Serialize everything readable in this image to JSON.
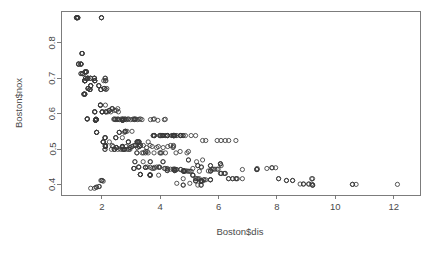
{
  "chart_data": {
    "type": "scatter",
    "title": "",
    "xlabel": "Boston$dis",
    "ylabel": "Boston$nox",
    "xlim": [
      0.6,
      12.9
    ],
    "ylim": [
      0.37,
      0.89
    ],
    "xticks": [
      2,
      4,
      6,
      8,
      10,
      12
    ],
    "xtick_labels": [
      "2",
      "4",
      "6",
      "8",
      "10",
      "12"
    ],
    "yticks": [
      0.4,
      0.5,
      0.6,
      0.7,
      0.8
    ],
    "ytick_labels": [
      "0.4",
      "0.5",
      "0.6",
      "0.7",
      "0.8"
    ],
    "grid": false,
    "legend": null,
    "point_symbol": "open-circle",
    "point_color": "#3a3a3a",
    "background_color": "#ffffff",
    "n_points": 506,
    "x": [
      4.09,
      4.9671,
      4.9671,
      6.0622,
      6.0622,
      6.0622,
      5.5605,
      5.9505,
      6.0821,
      6.5921,
      6.3467,
      6.2267,
      5.4509,
      4.7075,
      4.4619,
      4.4986,
      4.4986,
      4.2579,
      3.7965,
      3.7979,
      4.0123,
      3.9769,
      4.0952,
      4.3996,
      4.4546,
      4.682,
      4.4534,
      4.4547,
      4.239,
      4.233,
      4.175,
      3.99,
      3.7872,
      3.7598,
      3.7598,
      3.7979,
      2.7778,
      2.7778,
      2.7147,
      2.421,
      2.1069,
      2.1069,
      2.4329,
      2.4329,
      2.5451,
      2.7592,
      3.3175,
      3.3175,
      3.3175,
      3.3175,
      3.4952,
      3.4952,
      3.4952,
      3.6659,
      4.498,
      4.498,
      4.4986,
      4.2392,
      4.2392,
      5.2119,
      5.2119,
      5.2119,
      4.5667,
      5.4007,
      5.4007,
      5.4007,
      5.7209,
      5.7209,
      6.0877,
      5.2873,
      5.2873,
      4.7872,
      4.7872,
      4.7872,
      5.4007,
      5.4007,
      5.7209,
      5.7209,
      5.7209,
      4.8122,
      4.8122,
      4.8122,
      4.8122,
      3.6526,
      3.6526,
      3.6526,
      3.6526,
      3.6526,
      3.2628,
      3.2628,
      3.2628,
      3.1992,
      3.1992,
      3.1323,
      3.1323,
      3.0993,
      3.0993,
      3.0993,
      3.2721,
      3.2721,
      3.2721,
      3.2157,
      3.2157,
      3.2157,
      2.7019,
      2.7019,
      2.7019,
      2.7019,
      2.4961,
      2.4961,
      2.4961,
      2.4961,
      2.1224,
      2.1224,
      2.1224,
      2.1224,
      2.1222,
      2.1222,
      2.1222,
      2.0459,
      2.0459,
      2.0459,
      2.0459,
      2.1107,
      2.1107,
      2.1107,
      2.1107,
      1.8209,
      1.8209,
      1.8209,
      1.8209,
      1.7821,
      1.7821,
      1.7821,
      1.7821,
      1.9512,
      1.9512,
      1.9512,
      1.9512,
      1.9865,
      1.9865,
      1.9865,
      2.0107,
      2.0107,
      2.0107,
      2.0107,
      1.7984,
      1.7984,
      1.7984,
      1.7984,
      1.7554,
      1.7554,
      1.7554,
      1.7554,
      1.8125,
      1.8125,
      1.8125,
      1.8125,
      1.5004,
      1.5004,
      1.5004,
      1.5004,
      1.618,
      1.618,
      1.618,
      1.618,
      1.5916,
      1.5916,
      1.5916,
      1.5916,
      1.5296,
      1.5296,
      1.5296,
      1.5296,
      1.7455,
      1.7455,
      1.7455,
      1.7455,
      1.4191,
      1.4191,
      1.4191,
      1.4191,
      1.4118,
      1.4118,
      1.4118,
      1.4118,
      1.4395,
      1.4395,
      1.4395,
      1.4261,
      1.4261,
      1.4261,
      1.4672,
      1.4672,
      1.4672,
      1.4672,
      1.3216,
      1.3216,
      1.3216,
      1.3216,
      1.2852,
      1.2852,
      1.2852,
      1.2852,
      1.2024,
      1.2024,
      1.2024,
      1.2024,
      1.1691,
      1.1691,
      1.137,
      1.137,
      1.1296,
      1.1296,
      1.1781,
      1.1781,
      1.2852,
      1.2852,
      1.3449,
      1.3449,
      1.3449,
      1.3861,
      1.3861,
      1.3861,
      1.4165,
      1.4165,
      1.4165,
      1.5192,
      1.5192,
      1.5192,
      1.5192,
      1.6102,
      1.6102,
      1.6102,
      1.7572,
      1.7572,
      1.7572,
      1.7572,
      1.8956,
      1.8956,
      1.8956,
      1.9669,
      1.9669,
      1.9669,
      2.0788,
      2.0788,
      2.0788,
      2.1399,
      2.1399,
      2.1399,
      2.2565,
      2.2565,
      2.2565,
      2.3534,
      2.3534,
      2.3534,
      2.4775,
      2.4775,
      2.4775,
      2.5961,
      2.5961,
      2.5961,
      2.71,
      2.71,
      2.71,
      2.7998,
      2.7998,
      2.7998,
      2.9084,
      2.9084,
      2.9084,
      2.9634,
      2.9634,
      3.0334,
      3.0334,
      3.0993,
      3.1523,
      3.1523,
      3.2157,
      3.2797,
      3.2797,
      3.3175,
      3.3751,
      3.4217,
      3.4952,
      3.5549,
      3.5875,
      3.6519,
      3.6659,
      3.724,
      3.7872,
      3.8771,
      3.9454,
      3.9769,
      4.0123,
      4.0522,
      4.0905,
      4.1007,
      4.1403,
      4.18,
      4.239,
      4.2579,
      4.3549,
      4.4377,
      4.4619,
      4.4986,
      4.5026,
      4.5404,
      4.5667,
      4.6947,
      4.7075,
      4.7794,
      4.8122,
      4.8628,
      4.9158,
      4.9671,
      5.0141,
      5.0589,
      5.1167,
      5.1167,
      5.1167,
      5.2119,
      5.2447,
      5.2873,
      5.34,
      5.4007,
      5.4007,
      5.4159,
      5.4509,
      5.4917,
      5.5027,
      5.5605,
      5.6484,
      5.7209,
      5.7209,
      5.7321,
      5.7737,
      5.815,
      5.8736,
      5.9505,
      5.9853,
      6.0622,
      6.0877,
      6.0877,
      6.1899,
      6.2196,
      6.2267,
      6.3361,
      6.3467,
      6.4798,
      6.4798,
      6.5921,
      6.6115,
      6.6407,
      6.8147,
      6.8147,
      7.3073,
      7.3073,
      7.3197,
      7.3197,
      7.6534,
      7.8278,
      7.8278,
      7.9549,
      8.0555,
      8.0555,
      8.3248,
      8.3248,
      8.5353,
      8.5353,
      8.7921,
      8.9067,
      8.9067,
      9.0892,
      9.0892,
      9.1876,
      9.1876,
      9.2203,
      9.2203,
      9.2229,
      9.2229,
      10.5857,
      10.5857,
      10.7103,
      12.1265,
      1.6166,
      1.7455,
      1.8026,
      1.8209,
      1.8946,
      1.9142,
      1.9669,
      1.9976,
      2.0107,
      2.0459,
      2.0635,
      2.1069,
      2.1222,
      2.1224,
      2.1247,
      2.1398,
      2.1399,
      2.1705,
      2.2004,
      2.2565,
      2.3053,
      2.3274,
      2.3534,
      2.3817,
      2.4091,
      2.4298,
      2.4329,
      2.4527,
      2.4775,
      2.4961,
      2.5194,
      2.5403,
      2.5451,
      2.5671,
      2.5779,
      2.5961,
      2.6403,
      2.6775,
      2.7019,
      2.7092,
      2.71,
      2.7147,
      2.7227,
      2.7344,
      2.7592,
      2.7778,
      2.7986,
      2.7998,
      2.8237,
      2.8408,
      2.8617,
      2.8715,
      2.8927,
      2.9084,
      2.922,
      2.9634,
      2.9857,
      3.0334,
      3.0598,
      3.0993,
      3.1121,
      3.1323,
      3.1523,
      3.1992,
      3.2157,
      3.2628,
      3.2721,
      3.2797,
      3.3175,
      3.3317,
      3.3751,
      3.4145,
      3.4217,
      3.4952,
      3.5325,
      3.5549,
      3.5875,
      3.6519,
      3.6526,
      3.6659,
      3.724,
      3.7598,
      3.7872,
      3.7965,
      3.7979,
      3.8771,
      3.9175,
      3.9342,
      3.9454,
      3.9769,
      3.99,
      4.0123,
      4.0522,
      4.0905,
      4.0952,
      4.1007,
      4.1403,
      4.175,
      4.18,
      4.233,
      4.239,
      4.2392,
      4.2579,
      4.3549,
      4.3996,
      4.4377,
      4.4534,
      4.4546,
      4.4547,
      4.4619,
      4.498,
      4.4986,
      4.5026,
      4.5404,
      4.5667,
      4.682,
      4.6947,
      4.7075,
      4.7794,
      4.7872,
      4.8122,
      4.8628,
      4.9158,
      4.9671,
      5.0141,
      5.0589,
      5.1167,
      5.2119,
      5.2447,
      5.2873,
      5.34,
      5.4007,
      5.4159,
      5.4509
    ],
    "y": [
      0.538,
      0.469,
      0.469,
      0.458,
      0.458,
      0.458,
      0.524,
      0.524,
      0.524,
      0.524,
      0.524,
      0.524,
      0.524,
      0.538,
      0.538,
      0.538,
      0.538,
      0.538,
      0.538,
      0.538,
      0.538,
      0.538,
      0.538,
      0.538,
      0.538,
      0.538,
      0.538,
      0.538,
      0.538,
      0.538,
      0.538,
      0.538,
      0.538,
      0.538,
      0.538,
      0.538,
      0.499,
      0.499,
      0.499,
      0.499,
      0.499,
      0.499,
      0.499,
      0.499,
      0.499,
      0.499,
      0.428,
      0.428,
      0.428,
      0.428,
      0.448,
      0.448,
      0.448,
      0.448,
      0.439,
      0.439,
      0.439,
      0.439,
      0.439,
      0.41,
      0.41,
      0.41,
      0.403,
      0.411,
      0.411,
      0.411,
      0.453,
      0.453,
      0.453,
      0.453,
      0.453,
      0.4161,
      0.398,
      0.398,
      0.409,
      0.409,
      0.413,
      0.413,
      0.413,
      0.437,
      0.437,
      0.437,
      0.437,
      0.426,
      0.426,
      0.426,
      0.426,
      0.426,
      0.449,
      0.449,
      0.449,
      0.489,
      0.489,
      0.464,
      0.464,
      0.445,
      0.445,
      0.445,
      0.52,
      0.52,
      0.52,
      0.52,
      0.52,
      0.52,
      0.507,
      0.507,
      0.507,
      0.507,
      0.504,
      0.504,
      0.504,
      0.504,
      0.507,
      0.507,
      0.507,
      0.507,
      0.51,
      0.51,
      0.51,
      0.52,
      0.52,
      0.52,
      0.52,
      0.532,
      0.532,
      0.532,
      0.532,
      0.547,
      0.547,
      0.547,
      0.547,
      0.581,
      0.581,
      0.581,
      0.581,
      0.624,
      0.624,
      0.624,
      0.624,
      0.871,
      0.871,
      0.871,
      0.605,
      0.605,
      0.605,
      0.605,
      0.584,
      0.584,
      0.584,
      0.584,
      0.605,
      0.605,
      0.605,
      0.605,
      0.583,
      0.583,
      0.583,
      0.583,
      0.585,
      0.585,
      0.585,
      0.585,
      0.679,
      0.679,
      0.679,
      0.679,
      0.668,
      0.668,
      0.668,
      0.668,
      0.671,
      0.671,
      0.671,
      0.671,
      0.7,
      0.7,
      0.7,
      0.7,
      0.693,
      0.693,
      0.693,
      0.693,
      0.693,
      0.693,
      0.693,
      0.693,
      0.7,
      0.7,
      0.7,
      0.718,
      0.718,
      0.718,
      0.718,
      0.718,
      0.718,
      0.718,
      0.77,
      0.77,
      0.77,
      0.77,
      0.74,
      0.74,
      0.74,
      0.74,
      0.74,
      0.74,
      0.74,
      0.74,
      0.871,
      0.871,
      0.871,
      0.871,
      0.871,
      0.871,
      0.871,
      0.871,
      0.713,
      0.713,
      0.713,
      0.713,
      0.713,
      0.655,
      0.655,
      0.655,
      0.655,
      0.655,
      0.655,
      0.7,
      0.7,
      0.7,
      0.7,
      0.7,
      0.7,
      0.7,
      0.693,
      0.693,
      0.693,
      0.693,
      0.679,
      0.679,
      0.679,
      0.668,
      0.668,
      0.668,
      0.671,
      0.671,
      0.671,
      0.605,
      0.605,
      0.605,
      0.609,
      0.609,
      0.609,
      0.614,
      0.614,
      0.614,
      0.532,
      0.532,
      0.532,
      0.547,
      0.547,
      0.547,
      0.581,
      0.581,
      0.581,
      0.55,
      0.55,
      0.55,
      0.52,
      0.52,
      0.52,
      0.504,
      0.504,
      0.507,
      0.507,
      0.51,
      0.51,
      0.51,
      0.504,
      0.507,
      0.507,
      0.51,
      0.489,
      0.489,
      0.493,
      0.493,
      0.489,
      0.464,
      0.464,
      0.445,
      0.445,
      0.449,
      0.449,
      0.449,
      0.489,
      0.489,
      0.464,
      0.464,
      0.445,
      0.445,
      0.445,
      0.4429,
      0.4429,
      0.4429,
      0.4429,
      0.4429,
      0.4429,
      0.442,
      0.442,
      0.442,
      0.442,
      0.4379,
      0.4379,
      0.4379,
      0.4379,
      0.437,
      0.437,
      0.437,
      0.426,
      0.426,
      0.426,
      0.4161,
      0.4161,
      0.4161,
      0.4161,
      0.398,
      0.398,
      0.409,
      0.409,
      0.413,
      0.413,
      0.413,
      0.4379,
      0.4379,
      0.4379,
      0.4379,
      0.4429,
      0.4429,
      0.4429,
      0.4429,
      0.4429,
      0.431,
      0.431,
      0.431,
      0.431,
      0.431,
      0.431,
      0.4161,
      0.4161,
      0.4161,
      0.4161,
      0.4161,
      0.4161,
      0.4161,
      0.4161,
      0.442,
      0.442,
      0.442,
      0.442,
      0.445,
      0.445,
      0.447,
      0.447,
      0.447,
      0.4161,
      0.4161,
      0.411,
      0.411,
      0.411,
      0.411,
      0.401,
      0.401,
      0.401,
      0.401,
      0.401,
      0.401,
      0.4161,
      0.4161,
      0.398,
      0.398,
      0.398,
      0.4,
      0.4,
      0.4,
      0.4,
      0.389,
      0.389,
      0.392,
      0.392,
      0.394,
      0.394,
      0.411,
      0.411,
      0.411,
      0.409,
      0.693,
      0.7,
      0.693,
      0.624,
      0.7,
      0.693,
      0.668,
      0.671,
      0.605,
      0.52,
      0.605,
      0.499,
      0.51,
      0.507,
      0.584,
      0.585,
      0.609,
      0.583,
      0.584,
      0.609,
      0.583,
      0.585,
      0.614,
      0.605,
      0.584,
      0.583,
      0.499,
      0.585,
      0.532,
      0.504,
      0.583,
      0.584,
      0.499,
      0.585,
      0.583,
      0.547,
      0.584,
      0.585,
      0.507,
      0.583,
      0.55,
      0.499,
      0.584,
      0.585,
      0.499,
      0.499,
      0.583,
      0.55,
      0.584,
      0.585,
      0.583,
      0.584,
      0.585,
      0.52,
      0.583,
      0.52,
      0.584,
      0.507,
      0.585,
      0.51,
      0.583,
      0.464,
      0.51,
      0.489,
      0.504,
      0.449,
      0.52,
      0.51,
      0.428,
      0.583,
      0.507,
      0.584,
      0.489,
      0.448,
      0.585,
      0.504,
      0.581,
      0.507,
      0.426,
      0.448,
      0.489,
      0.538,
      0.538,
      0.538,
      0.538,
      0.504,
      0.583,
      0.584,
      0.489,
      0.538,
      0.538,
      0.538,
      0.507,
      0.51,
      0.538,
      0.504,
      0.507,
      0.538,
      0.51,
      0.538,
      0.538,
      0.538,
      0.538,
      0.489,
      0.538,
      0.493,
      0.538,
      0.538,
      0.538,
      0.538,
      0.439,
      0.538,
      0.489,
      0.493,
      0.403,
      0.538,
      0.445,
      0.538,
      0.464,
      0.398,
      0.437,
      0.449,
      0.449,
      0.469,
      0.4429,
      0.4429,
      0.4379,
      0.41,
      0.4429,
      0.453,
      0.4429,
      0.411,
      0.4429,
      0.524
    ]
  },
  "plot_geometry": {
    "box_left": 61,
    "box_right": 420,
    "box_top": 11,
    "box_bottom": 195,
    "tick_length": 4,
    "point_radius": 2.1
  }
}
